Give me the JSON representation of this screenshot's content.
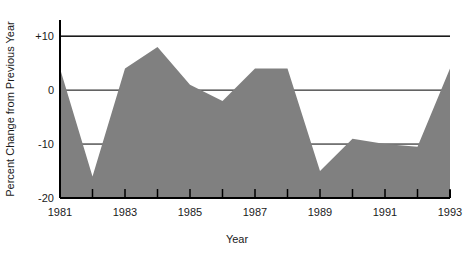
{
  "chart_data": {
    "type": "area",
    "title": "",
    "xlabel": "Year",
    "ylabel": "Percent Change from Previous Year",
    "x": [
      1981,
      1982,
      1983,
      1984,
      1985,
      1986,
      1987,
      1988,
      1989,
      1990,
      1991,
      1992,
      1993
    ],
    "values": [
      4,
      -16,
      4,
      8,
      1,
      -2,
      4,
      4,
      -15,
      -9,
      -10,
      -10.5,
      4
    ],
    "categories": [
      "1981",
      "1982",
      "1983",
      "1984",
      "1985",
      "1986",
      "1987",
      "1988",
      "1989",
      "1990",
      "1991",
      "1992",
      "1993"
    ],
    "xlim": [
      1981,
      1993
    ],
    "ylim": [
      -20,
      13
    ],
    "xticks": [
      1981,
      1982,
      1983,
      1984,
      1985,
      1986,
      1987,
      1988,
      1989,
      1990,
      1991,
      1992,
      1993
    ],
    "xtick_labels": [
      "1981",
      "",
      "1983",
      "",
      "1985",
      "",
      "1987",
      "",
      "1989",
      "",
      "1991",
      "",
      "1993"
    ],
    "yticks": [
      10,
      0,
      -10,
      -20
    ],
    "ytick_labels": [
      "+10",
      "0",
      "-10",
      "-20"
    ],
    "grid": true,
    "gridlines_y": [
      10,
      0,
      -10
    ],
    "legend": false,
    "legend_position": "none",
    "series_name": "Percent change from previous year",
    "fill_color": "#808080",
    "axis_color": "#000000",
    "grid_color": "#000000",
    "background_color": "#ffffff"
  },
  "axes": {
    "x_title": "Year",
    "y_title": "Percent Change from Previous Year",
    "y_labels": [
      "+10",
      "0",
      "-10",
      "-20"
    ],
    "x_labels": [
      "1981",
      "1983",
      "1985",
      "1987",
      "1989",
      "1991",
      "1993"
    ]
  }
}
